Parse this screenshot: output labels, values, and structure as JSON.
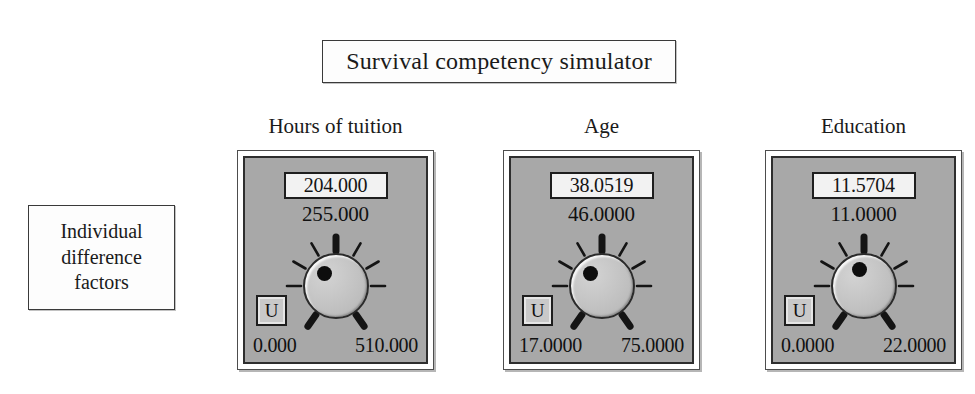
{
  "title": {
    "text": "Survival competency simulator"
  },
  "group_label": {
    "lines": [
      "Individual",
      "difference",
      "factors"
    ]
  },
  "colors": {
    "page_background": "#ffffff",
    "panel_face": "#a8a8a8",
    "panel_frame": "#ffffff",
    "panel_border": "#2e2e2e",
    "readout_background": "#f2f2f2",
    "knob_face": "#c2c2c2",
    "tick_color": "#141414",
    "text": "#111111"
  },
  "panels": [
    {
      "header": "Hours of tuition",
      "value": "204.000",
      "setpoint": "255.000",
      "min": "0.000",
      "max": "510.000",
      "unit_button": "U",
      "knob_angle_deg": -30
    },
    {
      "header": "Age",
      "value": "38.0519",
      "setpoint": "46.0000",
      "min": "17.0000",
      "max": "75.0000",
      "unit_button": "U",
      "knob_angle_deg": -30
    },
    {
      "header": "Education",
      "value": "11.5704",
      "setpoint": "11.0000",
      "min": "0.0000",
      "max": "22.0000",
      "unit_button": "U",
      "knob_angle_deg": -12
    }
  ],
  "knob_ticks": {
    "major_angles_deg": [
      0,
      145,
      215
    ],
    "minor_angles_deg": [
      30,
      60,
      90,
      270,
      300,
      330
    ]
  },
  "layout": {
    "panel_left_positions": [
      237,
      503,
      765
    ],
    "panel_width": 197,
    "panel_top": 150
  }
}
